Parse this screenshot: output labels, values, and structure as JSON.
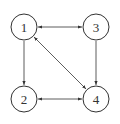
{
  "diagram": {
    "type": "directed-graph",
    "nodes": [
      {
        "id": "1",
        "label": "1",
        "cx": 24,
        "cy": 27
      },
      {
        "id": "2",
        "label": "2",
        "cx": 24,
        "cy": 99
      },
      {
        "id": "3",
        "label": "3",
        "cx": 96,
        "cy": 27
      },
      {
        "id": "4",
        "label": "4",
        "cx": 96,
        "cy": 99
      }
    ],
    "edges": [
      {
        "from": "1",
        "to": "3",
        "bidirectional": true
      },
      {
        "from": "1",
        "to": "2",
        "bidirectional": false
      },
      {
        "from": "3",
        "to": "4",
        "bidirectional": false
      },
      {
        "from": "2",
        "to": "4",
        "bidirectional": true
      },
      {
        "from": "1",
        "to": "4",
        "bidirectional": true
      }
    ],
    "colors": {
      "stroke": "#333333",
      "background": "#ffffff"
    }
  }
}
